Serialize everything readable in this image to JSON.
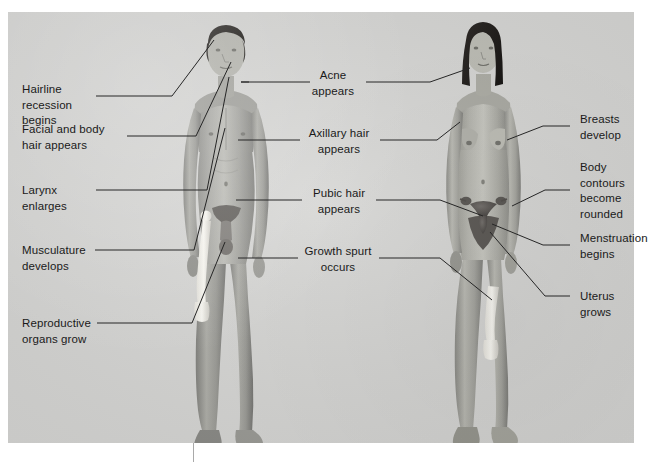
{
  "figure": {
    "panel_color": "#d6d6d4",
    "text_color": "#1a1a1a",
    "leader_line_color": "#2b2b2b",
    "background_color": "#ffffff"
  },
  "figures": {
    "male": {
      "name": "adolescent male figure",
      "highlight": "femur bone",
      "side": "left"
    },
    "female": {
      "name": "adolescent female figure",
      "highlight": "uterus and ovaries",
      "side": "right"
    }
  },
  "labels": {
    "left": [
      {
        "id": "hairline-recession",
        "text": "Hairline\nrecession\nbegins"
      },
      {
        "id": "facial-body-hair",
        "text": "Facial and body\nhair appears"
      },
      {
        "id": "larynx-enlarges",
        "text": "Larynx\nenlarges"
      },
      {
        "id": "musculature-develops",
        "text": "Musculature\ndevelops"
      },
      {
        "id": "reproductive-organs",
        "text": "Reproductive\norgans grow"
      }
    ],
    "center": [
      {
        "id": "acne-appears",
        "text": "Acne\nappears"
      },
      {
        "id": "axillary-hair",
        "text": "Axillary hair\nappears"
      },
      {
        "id": "pubic-hair",
        "text": "Pubic hair\nappears"
      },
      {
        "id": "growth-spurt",
        "text": "Growth spurt\noccurs"
      }
    ],
    "right": [
      {
        "id": "breasts-develop",
        "text": "Breasts\ndevelop"
      },
      {
        "id": "body-contours",
        "text": "Body\ncontours\nbecome\nrounded"
      },
      {
        "id": "menstruation-begins",
        "text": "Menstruation\nbegins"
      },
      {
        "id": "uterus-grows",
        "text": "Uterus\ngrows"
      }
    ]
  }
}
